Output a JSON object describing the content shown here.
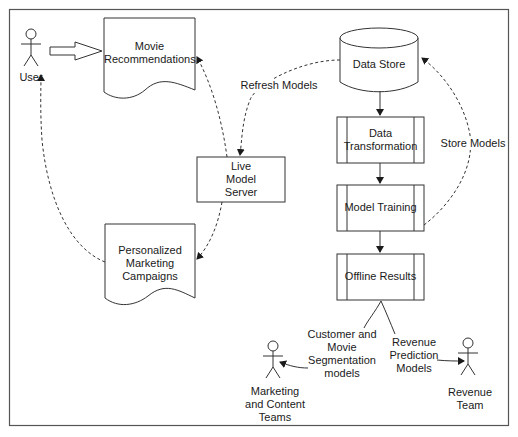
{
  "colors": {
    "stroke": "#333333",
    "frame": "#555555",
    "text": "#1a1a1a",
    "background": "#ffffff"
  },
  "actors": {
    "user": {
      "label": "User"
    },
    "marketing": {
      "label": "Marketing\nand Content\nTeams"
    },
    "revenue": {
      "label": "Revenue\nTeam"
    }
  },
  "documents": {
    "movie_recommendations": {
      "label": "Movie\nRecommendations"
    },
    "personalized_marketing": {
      "label": "Personalized\nMarketing\nCampaigns"
    }
  },
  "nodes": {
    "data_store": {
      "label": "Data Store",
      "shape": "cylinder"
    },
    "live_model_server": {
      "label": "Live\nModel\nServer",
      "shape": "rectangle"
    },
    "data_transformation": {
      "label": "Data\nTransformation",
      "shape": "process"
    },
    "model_training": {
      "label": "Model Training",
      "shape": "process"
    },
    "offline_results": {
      "label": "Offline Results",
      "shape": "process"
    }
  },
  "edge_labels": {
    "refresh_models": "Refresh Models",
    "store_models": "Store Models",
    "segmentation_models": "Customer and\nMovie\nSegmentation\nmodels",
    "revenue_prediction": "Revenue\nPrediction\nModels"
  }
}
